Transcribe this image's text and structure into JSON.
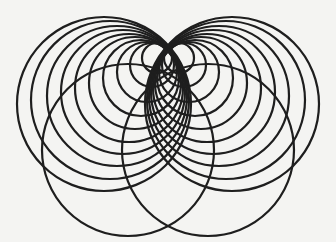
{
  "figure": {
    "title": "",
    "background_color": "#f4f4f2",
    "stroke_color": "#1e1e1e",
    "stroke_width": 2.2,
    "tangent_point": [
      168,
      46
    ],
    "left_family": [
      {
        "cx": 104,
        "cy": 104,
        "r": 87
      },
      {
        "cx": 110,
        "cy": 100,
        "r": 79
      },
      {
        "cx": 117,
        "cy": 96,
        "r": 70
      },
      {
        "cx": 123,
        "cy": 92,
        "r": 62
      },
      {
        "cx": 129,
        "cy": 88,
        "r": 54
      },
      {
        "cx": 135,
        "cy": 83,
        "r": 46
      },
      {
        "cx": 141,
        "cy": 78,
        "r": 38
      },
      {
        "cx": 147,
        "cy": 72,
        "r": 30
      },
      {
        "cx": 152,
        "cy": 65,
        "r": 22
      },
      {
        "cx": 157,
        "cy": 58,
        "r": 15
      }
    ],
    "right_family": [
      {
        "cx": 232,
        "cy": 104,
        "r": 87
      },
      {
        "cx": 226,
        "cy": 100,
        "r": 79
      },
      {
        "cx": 219,
        "cy": 96,
        "r": 70
      },
      {
        "cx": 213,
        "cy": 92,
        "r": 62
      },
      {
        "cx": 207,
        "cy": 88,
        "r": 54
      },
      {
        "cx": 201,
        "cy": 83,
        "r": 46
      },
      {
        "cx": 195,
        "cy": 78,
        "r": 38
      },
      {
        "cx": 189,
        "cy": 72,
        "r": 30
      },
      {
        "cx": 184,
        "cy": 65,
        "r": 22
      },
      {
        "cx": 179,
        "cy": 58,
        "r": 15
      }
    ],
    "large_circles": [
      {
        "cx": 128,
        "cy": 150,
        "r": 86
      },
      {
        "cx": 208,
        "cy": 150,
        "r": 86
      }
    ]
  }
}
